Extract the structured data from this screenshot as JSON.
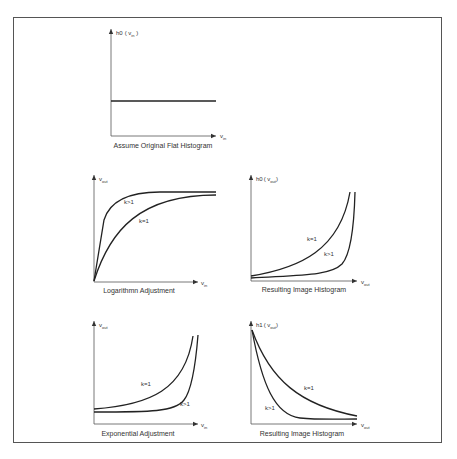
{
  "figure": {
    "panels": [
      {
        "id": "top",
        "caption": "Assume Original Flat Histogram",
        "y_axis_label": "h0",
        "y_axis_arg": "( v",
        "y_axis_arg_sub": "in",
        "y_axis_close": " )",
        "x_axis_label": "v",
        "x_axis_sub": "in"
      },
      {
        "id": "mid-left",
        "caption": "Logarithmn Adjustment",
        "y_axis_label": "v",
        "y_axis_sub": "out",
        "x_axis_label": "v",
        "x_axis_sub": "in",
        "curve_labels": [
          "k>1",
          "k=1"
        ]
      },
      {
        "id": "mid-right",
        "caption": "Resulting Image Histogram",
        "y_axis_label": "h0",
        "y_axis_arg": "( v",
        "y_axis_arg_sub": "out",
        "y_axis_close": ")",
        "x_axis_label": "v",
        "x_axis_sub": "out",
        "curve_labels": [
          "k=1",
          "k>1"
        ]
      },
      {
        "id": "bottom-left",
        "caption": "Exponential Adjustment",
        "y_axis_label": "v",
        "y_axis_sub": "out",
        "x_axis_label": "v",
        "x_axis_sub": "in",
        "curve_labels": [
          "k=1",
          "k>1"
        ]
      },
      {
        "id": "bottom-right",
        "caption": "Resulting Image Histogram",
        "y_axis_label": "h1",
        "y_axis_arg": "( v",
        "y_axis_arg_sub": "out",
        "y_axis_close": ")",
        "x_axis_label": "v",
        "x_axis_sub": "out",
        "curve_labels": [
          "k=1",
          "k>1"
        ]
      }
    ]
  },
  "colors": {
    "frame": "#555555",
    "axis": "#555555",
    "curve": "#222222",
    "text": "#333333"
  }
}
